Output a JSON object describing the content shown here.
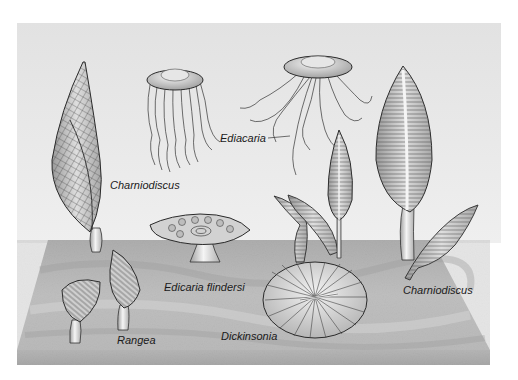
{
  "illustration": {
    "subject": "Ediacaran fauna on seafloor slab",
    "colors": {
      "background": "#ffffff",
      "water_backdrop": "#e6e6e6",
      "sediment_top": "#bdbdbd",
      "sediment_side": "#a8a8a8",
      "organism_fill": "#d0d0d0",
      "outline": "#2a2a2a"
    }
  },
  "labels": {
    "charniodiscus_left": "Charniodiscus",
    "ediacaria": "Ediacaria",
    "edicaria_flindersi": "Edicaria flindersi",
    "rangea": "Rangea",
    "dickinsonia": "Dickinsonia",
    "charniodiscus_right": "Charniodiscus"
  },
  "organisms": [
    {
      "name": "Charniodiscus",
      "form": "tall twisted frond with grid texture",
      "position": "left"
    },
    {
      "name": "Ediacaria",
      "form": "jellyfish medusa (two individuals)",
      "position": "top center"
    },
    {
      "name": "Edicaria flindersi",
      "form": "stalked disc with concentric pattern",
      "position": "center"
    },
    {
      "name": "Rangea",
      "form": "two leaf-like fronds on short stalks",
      "position": "lower left"
    },
    {
      "name": "Dickinsonia",
      "form": "oval ribbed disc",
      "position": "lower center"
    },
    {
      "name": "Charniodiscus",
      "form": "tall striated fronds (group)",
      "position": "right"
    }
  ]
}
